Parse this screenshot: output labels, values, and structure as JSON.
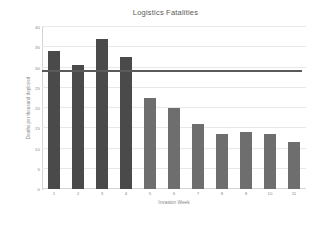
{
  "chart_data": {
    "type": "bar",
    "title": "Logistics Fatalities",
    "xlabel": "Invasion Week",
    "ylabel": "Deaths per thousand deployed",
    "categories": [
      "1",
      "2",
      "3",
      "4",
      "5",
      "6",
      "7",
      "8",
      "9",
      "10",
      "11"
    ],
    "values": [
      34,
      30.5,
      37,
      32.5,
      22.5,
      20,
      16,
      13.5,
      14,
      13.5,
      11.5
    ],
    "series": [
      {
        "name": "Deaths per thousand deployed",
        "values": [
          34,
          30.5,
          37,
          32.5,
          22.5,
          20,
          16,
          13.5,
          14,
          13.5,
          11.5
        ]
      }
    ],
    "ylim": [
      0,
      40
    ],
    "yticks": [
      0,
      5,
      10,
      15,
      20,
      25,
      30,
      35,
      40
    ],
    "ytick_labels": [
      "0",
      "5",
      "10",
      "15",
      "20",
      "25",
      "30",
      "35",
      "40"
    ],
    "grid": true,
    "legend": "none",
    "annotations": [
      {
        "name": "target-line",
        "type": "horizontal-line",
        "value": 29,
        "color": "#5a5a5a"
      }
    ],
    "bar_colors": {
      "early_weeks": "#4a4a4a",
      "later_weeks": "#6e6e6e"
    },
    "bar_color_split_index": 4
  },
  "colors": {
    "background": "#ffffff",
    "text": "#595959",
    "tick_text": "#8a8a8a",
    "gridline": "#e8e8e8",
    "axis": "#d4d4d4"
  }
}
